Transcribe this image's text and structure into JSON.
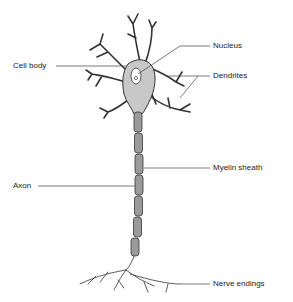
{
  "diagram": {
    "labels": {
      "nucleus": "Nucleus",
      "cell_body": "Cell body",
      "dendrites": "Dendrites",
      "myelin_sheath": "Myelin sheath",
      "axon": "Axon",
      "nerve_endings": "Nerve endings"
    },
    "colors": {
      "cell_fill": "#c8c8c8",
      "outline": "#333333",
      "myelin_fill": "#9a9a9a",
      "label_text": "#222222",
      "background": "#ffffff"
    }
  }
}
